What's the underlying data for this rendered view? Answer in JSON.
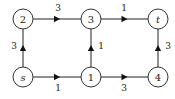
{
  "diagram": {
    "type": "directed-weighted-graph",
    "nodes": [
      {
        "id": "2",
        "label": "2",
        "x": 23,
        "y": 19
      },
      {
        "id": "3",
        "label": "3",
        "x": 91,
        "y": 19
      },
      {
        "id": "t",
        "label": "t",
        "x": 158,
        "y": 19
      },
      {
        "id": "s",
        "label": "s",
        "x": 23,
        "y": 77
      },
      {
        "id": "1",
        "label": "1",
        "x": 91,
        "y": 77
      },
      {
        "id": "4",
        "label": "4",
        "x": 158,
        "y": 77
      }
    ],
    "edges": [
      {
        "from": "2",
        "to": "3",
        "weight": "3",
        "label_x": 58,
        "label_y": 8
      },
      {
        "from": "3",
        "to": "t",
        "weight": "1",
        "label_x": 124,
        "label_y": 8
      },
      {
        "from": "s",
        "to": "2",
        "weight": "3",
        "label_x": 14,
        "label_y": 46
      },
      {
        "from": "1",
        "to": "3",
        "weight": "1",
        "label_x": 101,
        "label_y": 46
      },
      {
        "from": "4",
        "to": "t",
        "weight": "3",
        "label_x": 168,
        "label_y": 46
      },
      {
        "from": "s",
        "to": "1",
        "weight": "1",
        "label_x": 58,
        "label_y": 88
      },
      {
        "from": "1",
        "to": "4",
        "weight": "3",
        "label_x": 124,
        "label_y": 88
      }
    ]
  }
}
